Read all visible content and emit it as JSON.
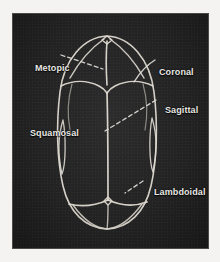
{
  "figure": {
    "background_color": "#232323",
    "line_color": "#e3e2dd",
    "label_color": "#e8e7e3",
    "paper_color": "#f4f3f1",
    "view": "superior (top-down)",
    "labels": [
      {
        "id": "metopic",
        "text": "Metopic",
        "leader": "dashed",
        "side": "left",
        "points_to": "midline suture between the frontal bones"
      },
      {
        "id": "coronal",
        "text": "Coronal",
        "leader": "solid-curve",
        "side": "right",
        "points_to": "suture between frontal and parietal bones"
      },
      {
        "id": "sagittal",
        "text": "Sagittal",
        "leader": "dashed",
        "side": "right",
        "points_to": "midline suture between the parietal bones"
      },
      {
        "id": "squamosal",
        "text": "Squamosal",
        "leader": "none",
        "side": "left",
        "points_to": "suture along the lateral temporal margin"
      },
      {
        "id": "lambdoidal",
        "text": "Lambdoidal",
        "leader": "dashed",
        "side": "right",
        "points_to": "suture between parietal and occipital bones"
      }
    ],
    "structures": [
      "skull outline (oval)",
      "anterior fontanelle",
      "posterior fontanelle",
      "frontal bones",
      "parietal bones",
      "occipital bone",
      "temporal squama"
    ]
  }
}
